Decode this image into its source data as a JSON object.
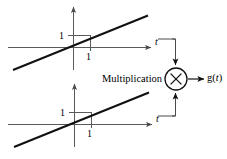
{
  "figure": {
    "type": "block-diagram",
    "labels": {
      "multiplication": "Multiplication",
      "output": "g(t)",
      "output_base": "g(",
      "output_var": "t",
      "output_close": ")"
    },
    "colors": {
      "ink": "#000000",
      "axis": "#5a5a5a",
      "background": "#ffffff"
    },
    "multiplier": {
      "symbol": "×",
      "center_x": 176,
      "center_y": 79,
      "radius": 11
    }
  },
  "plots": [
    {
      "id": "top-plot",
      "name": "upper-ramp-plot",
      "type": "line",
      "title": "",
      "xlabel": "t",
      "ylabel": "",
      "x": [
        -2.6,
        3.4
      ],
      "y": [
        -2.6,
        3.4
      ],
      "series": [
        {
          "name": "ramp",
          "slope": 1,
          "intercept": 0,
          "values": [
            -2.6,
            3.4
          ]
        }
      ],
      "x_ticks": [
        {
          "value": 1,
          "label": "1"
        }
      ],
      "y_ticks": [
        {
          "value": 1,
          "label": "1"
        }
      ],
      "grid": false,
      "legend": "none",
      "annotations": [
        {
          "text": "1",
          "target": "y-axis-tick"
        },
        {
          "text": "1",
          "target": "x-axis-tick"
        },
        {
          "text": "t",
          "target": "x-axis-label"
        }
      ]
    },
    {
      "id": "bottom-plot",
      "name": "lower-ramp-plot",
      "type": "line",
      "title": "",
      "xlabel": "t",
      "ylabel": "",
      "x": [
        -2.6,
        3.4
      ],
      "y": [
        -2.6,
        3.4
      ],
      "series": [
        {
          "name": "ramp",
          "slope": 1,
          "intercept": 0,
          "values": [
            -2.6,
            3.4
          ]
        }
      ],
      "x_ticks": [
        {
          "value": 1,
          "label": "1"
        }
      ],
      "y_ticks": [
        {
          "value": 1,
          "label": "1"
        }
      ],
      "grid": false,
      "legend": "none",
      "annotations": [
        {
          "text": "1",
          "target": "y-axis-tick"
        },
        {
          "text": "1",
          "target": "x-axis-tick"
        },
        {
          "text": "t",
          "target": "x-axis-label"
        }
      ]
    }
  ]
}
